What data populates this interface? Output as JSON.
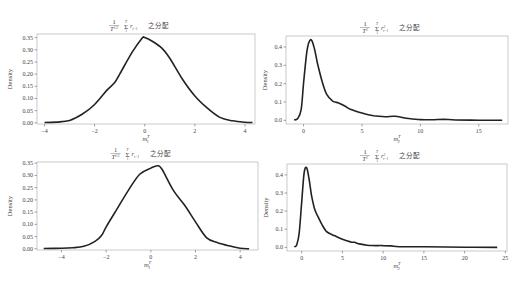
{
  "figure": {
    "ylabel": "Density",
    "title_suffix": "之分配"
  },
  "chart_data": [
    {
      "id": "top-left",
      "type": "line",
      "title": "1/T^{1/2} Σ_{t=1}^{T} r_{t-1} 之分配",
      "title_parts": {
        "frac": "1",
        "den": "T^1/2",
        "sum_top": "T",
        "sum_bot": "1",
        "term": "r_{t-1}",
        "suffix": "之分配"
      },
      "xlabel": "m_1^T",
      "ylabel": "Density",
      "xticks": [
        -4,
        -2,
        0,
        2,
        4
      ],
      "yticks": [
        0.0,
        0.05,
        0.1,
        0.15,
        0.2,
        0.25,
        0.3,
        0.35
      ],
      "ytick_labels": [
        "0.00",
        "0.05",
        "0.10",
        "0.15",
        "0.20",
        "0.25",
        "0.30",
        "0.35"
      ],
      "xlim": [
        -4.3,
        4.4
      ],
      "ylim": [
        -0.005,
        0.365
      ],
      "grid": false,
      "x": [
        -4.0,
        -3.5,
        -3.0,
        -2.5,
        -2.0,
        -1.5,
        -1.2,
        -1.0,
        -0.5,
        -0.1,
        0.0,
        0.3,
        0.7,
        1.0,
        1.5,
        2.0,
        2.5,
        3.0,
        3.5,
        4.0,
        4.3
      ],
      "y": [
        0.001,
        0.003,
        0.01,
        0.035,
        0.075,
        0.135,
        0.165,
        0.2,
        0.29,
        0.348,
        0.35,
        0.335,
        0.305,
        0.265,
        0.18,
        0.11,
        0.06,
        0.022,
        0.008,
        0.002,
        0.001
      ]
    },
    {
      "id": "top-right",
      "type": "line",
      "title": "1/T^2 Σ_{t=1}^{T} r^2_{t-1} 之分配",
      "title_parts": {
        "frac": "1",
        "den": "T^2",
        "sum_top": "T",
        "sum_bot": "1",
        "term": "r^2_{t-1}",
        "suffix": "之分配"
      },
      "xlabel": "m_2^T",
      "ylabel": "Density",
      "xticks": [
        0,
        5,
        10,
        15
      ],
      "yticks": [
        0.0,
        0.1,
        0.2,
        0.3,
        0.4
      ],
      "ytick_labels": [
        "0.0",
        "0.1",
        "0.2",
        "0.3",
        "0.4"
      ],
      "xlim": [
        -1.5,
        17.5
      ],
      "ylim": [
        -0.02,
        0.46
      ],
      "grid": false,
      "x": [
        -0.8,
        -0.5,
        -0.2,
        0.0,
        0.3,
        0.6,
        0.9,
        1.2,
        1.6,
        2.0,
        2.5,
        3.0,
        3.5,
        4.0,
        5.0,
        6.0,
        7.0,
        7.8,
        9.0,
        10.0,
        11.0,
        12.0,
        13.0,
        15.0,
        17.0
      ],
      "y": [
        0.002,
        0.01,
        0.06,
        0.2,
        0.38,
        0.44,
        0.4,
        0.31,
        0.21,
        0.14,
        0.105,
        0.095,
        0.08,
        0.06,
        0.04,
        0.025,
        0.02,
        0.022,
        0.01,
        0.004,
        0.003,
        0.006,
        0.002,
        0.001,
        0.0
      ]
    },
    {
      "id": "bottom-left",
      "type": "line",
      "title": "1/T^{1/2} Σ_{t=1}^{T} r_{t-1} 之分配",
      "title_parts": {
        "frac": "1",
        "den": "T^1/2",
        "sum_top": "T",
        "sum_bot": "1",
        "term": "r_{t-1}",
        "suffix": "之分配"
      },
      "xlabel": "m_1^T",
      "ylabel": "Density",
      "xticks": [
        -4,
        -2,
        0,
        2,
        4
      ],
      "yticks": [
        0.0,
        0.05,
        0.1,
        0.15,
        0.2,
        0.25,
        0.3,
        0.35
      ],
      "ytick_labels": [
        "0.00",
        "0.05",
        "0.10",
        "0.15",
        "0.20",
        "0.25",
        "0.30",
        "0.35"
      ],
      "xlim": [
        -5.1,
        4.8
      ],
      "ylim": [
        -0.005,
        0.355
      ],
      "grid": false,
      "x": [
        -4.8,
        -4.0,
        -3.5,
        -3.0,
        -2.5,
        -2.2,
        -2.0,
        -1.5,
        -1.0,
        -0.5,
        0.0,
        0.3,
        0.5,
        1.0,
        1.5,
        2.0,
        2.5,
        3.0,
        3.5,
        4.0,
        4.4
      ],
      "y": [
        0.001,
        0.002,
        0.004,
        0.01,
        0.03,
        0.055,
        0.09,
        0.165,
        0.24,
        0.305,
        0.33,
        0.34,
        0.325,
        0.24,
        0.18,
        0.11,
        0.045,
        0.025,
        0.012,
        0.002,
        0.0
      ]
    },
    {
      "id": "bottom-right",
      "type": "line",
      "title": "1/T^2 Σ_{t=1}^{T} r^2_{t-1} 之分配",
      "title_parts": {
        "frac": "1",
        "den": "T^2",
        "sum_top": "T",
        "sum_bot": "1",
        "term": "r^2_{t-1}",
        "suffix": "之分配"
      },
      "xlabel": "m_2^T",
      "ylabel": "Density",
      "xticks": [
        0,
        5,
        10,
        15,
        20,
        25
      ],
      "yticks": [
        0.0,
        0.1,
        0.2,
        0.3,
        0.4
      ],
      "ytick_labels": [
        "0.0",
        "0.1",
        "0.2",
        "0.3",
        "0.4"
      ],
      "xlim": [
        -1.8,
        25.2
      ],
      "ylim": [
        -0.02,
        0.46
      ],
      "grid": false,
      "x": [
        -0.9,
        -0.6,
        -0.3,
        0.0,
        0.3,
        0.6,
        0.9,
        1.2,
        1.6,
        2.0,
        2.5,
        3.0,
        3.5,
        4.0,
        5.0,
        6.0,
        6.5,
        7.0,
        8.0,
        9.0,
        10.0,
        11.0,
        12.0,
        15.0,
        20.0,
        24.0
      ],
      "y": [
        0.002,
        0.015,
        0.08,
        0.25,
        0.41,
        0.44,
        0.38,
        0.29,
        0.21,
        0.17,
        0.125,
        0.09,
        0.075,
        0.065,
        0.045,
        0.03,
        0.028,
        0.02,
        0.012,
        0.01,
        0.01,
        0.008,
        0.004,
        0.003,
        0.001,
        0.0
      ]
    }
  ],
  "layout": {
    "panels": [
      {
        "left": 37,
        "top": 34,
        "width": 218,
        "height": 90
      },
      {
        "left": 286,
        "top": 36,
        "width": 222,
        "height": 88
      },
      {
        "left": 37,
        "top": 162,
        "width": 221,
        "height": 88
      },
      {
        "left": 287,
        "top": 164,
        "width": 220,
        "height": 87
      }
    ],
    "line_color": "#222222",
    "frame_color": "#bdbdbd"
  }
}
